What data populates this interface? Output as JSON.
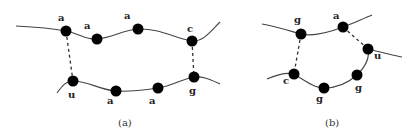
{
  "figure": {
    "panels": [
      {
        "id": "a",
        "caption": "(a)",
        "nodes": [
          {
            "label": "a"
          },
          {
            "label": "a"
          },
          {
            "label": "a"
          },
          {
            "label": "c"
          },
          {
            "label": "u"
          },
          {
            "label": "a"
          },
          {
            "label": "a"
          },
          {
            "label": "g"
          }
        ],
        "pairs": [
          [
            "a",
            "u"
          ],
          [
            "c",
            "g"
          ]
        ]
      },
      {
        "id": "b",
        "caption": "(b)",
        "nodes": [
          {
            "label": "g"
          },
          {
            "label": "a"
          },
          {
            "label": "u"
          },
          {
            "label": "g"
          },
          {
            "label": "g"
          },
          {
            "label": "c"
          }
        ],
        "pairs": [
          [
            "g",
            "c"
          ],
          [
            "a",
            "u"
          ]
        ]
      }
    ]
  }
}
